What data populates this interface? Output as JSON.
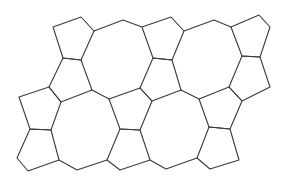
{
  "diagram": {
    "type": "tiling",
    "stroke_color": "#3a3a3a",
    "background": "#ffffff",
    "pentagons": [
      {
        "id": "p-top-left",
        "points": [
          [
            53,
            27
          ],
          [
            81,
            17
          ],
          [
            94,
            31
          ],
          [
            81,
            60
          ],
          [
            63,
            58
          ]
        ]
      },
      {
        "id": "p-top-middle",
        "points": [
          [
            142,
            27
          ],
          [
            171,
            17
          ],
          [
            184,
            31
          ],
          [
            172,
            60
          ],
          [
            153,
            58
          ]
        ]
      },
      {
        "id": "p-top-right",
        "points": [
          [
            231,
            27
          ],
          [
            259,
            15
          ],
          [
            270,
            27
          ],
          [
            260,
            57
          ],
          [
            242,
            56
          ]
        ]
      },
      {
        "id": "p-mid-left-upper",
        "points": [
          [
            63,
            58
          ],
          [
            81,
            60
          ],
          [
            92,
            90
          ],
          [
            61,
            102
          ],
          [
            49,
            87
          ]
        ]
      },
      {
        "id": "p-center-upper",
        "points": [
          [
            153,
            58
          ],
          [
            172,
            60
          ],
          [
            181,
            90
          ],
          [
            152,
            101
          ],
          [
            140,
            88
          ]
        ]
      },
      {
        "id": "p-right-upper",
        "points": [
          [
            242,
            56
          ],
          [
            260,
            57
          ],
          [
            270,
            87
          ],
          [
            242,
            101
          ],
          [
            229,
            87
          ]
        ]
      },
      {
        "id": "p-left",
        "points": [
          [
            19,
            97
          ],
          [
            49,
            87
          ],
          [
            61,
            102
          ],
          [
            51,
            130
          ],
          [
            30,
            129
          ]
        ]
      },
      {
        "id": "p-middle",
        "points": [
          [
            109,
            99
          ],
          [
            140,
            88
          ],
          [
            152,
            101
          ],
          [
            140,
            130
          ],
          [
            120,
            129
          ]
        ]
      },
      {
        "id": "p-right-middle",
        "points": [
          [
            199,
            99
          ],
          [
            229,
            87
          ],
          [
            242,
            101
          ],
          [
            230,
            129
          ],
          [
            209,
            127
          ]
        ]
      },
      {
        "id": "p-bottom-left",
        "points": [
          [
            30,
            129
          ],
          [
            51,
            130
          ],
          [
            59,
            160
          ],
          [
            28,
            171
          ],
          [
            17,
            158
          ]
        ]
      },
      {
        "id": "p-bottom-middle",
        "points": [
          [
            120,
            129
          ],
          [
            140,
            130
          ],
          [
            150,
            160
          ],
          [
            120,
            170
          ],
          [
            107,
            160
          ]
        ]
      },
      {
        "id": "p-bottom-right",
        "points": [
          [
            209,
            127
          ],
          [
            230,
            129
          ],
          [
            239,
            160
          ],
          [
            210,
            169
          ],
          [
            197,
            158
          ]
        ]
      }
    ],
    "connecting_edges": [
      {
        "id": "e-top-1",
        "points": [
          [
            94,
            31
          ],
          [
            123,
            20
          ],
          [
            142,
            27
          ]
        ]
      },
      {
        "id": "e-top-2",
        "points": [
          [
            184,
            31
          ],
          [
            214,
            20
          ],
          [
            231,
            27
          ]
        ]
      },
      {
        "id": "e-mid-1",
        "points": [
          [
            92,
            90
          ],
          [
            109,
            99
          ]
        ]
      },
      {
        "id": "e-mid-2",
        "points": [
          [
            181,
            90
          ],
          [
            199,
            99
          ]
        ]
      },
      {
        "id": "e-bottom-1",
        "points": [
          [
            59,
            160
          ],
          [
            77,
            170
          ],
          [
            107,
            160
          ]
        ]
      },
      {
        "id": "e-bottom-2",
        "points": [
          [
            150,
            160
          ],
          [
            166,
            169
          ],
          [
            197,
            158
          ]
        ]
      }
    ]
  }
}
